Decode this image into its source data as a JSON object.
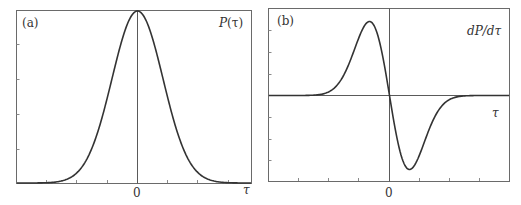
{
  "chart_data": [
    {
      "type": "line",
      "panel_label": "(a)",
      "title": "P(τ)",
      "xlabel": "τ",
      "ylabel": "",
      "x_ticks_labeled": [
        "0"
      ],
      "description": "Gaussian pulse centered at τ=0",
      "function": "gaussian",
      "x": [
        -4,
        -3,
        -2,
        -1.5,
        -1,
        -0.5,
        0,
        0.5,
        1,
        1.5,
        2,
        3,
        4
      ],
      "values": [
        0.0003,
        0.011,
        0.135,
        0.325,
        0.607,
        0.882,
        1.0,
        0.882,
        0.607,
        0.325,
        0.135,
        0.011,
        0.0003
      ],
      "xlim": [
        -4.7,
        4.5
      ],
      "ylim": [
        0,
        1
      ],
      "grid": false,
      "vertical_line_at_x": 0
    },
    {
      "type": "line",
      "panel_label": "(b)",
      "title": "dP/dτ",
      "xlabel": "τ",
      "ylabel": "",
      "x_ticks_labeled": [
        "0"
      ],
      "description": "Derivative of Gaussian: positive lobe for τ<0, negative lobe for τ>0",
      "function": "gaussian-derivative",
      "x": [
        -4,
        -3,
        -2,
        -1.5,
        -1,
        -0.5,
        0,
        0.5,
        1,
        1.5,
        2,
        3,
        4
      ],
      "values": [
        0.001,
        0.034,
        0.27,
        0.49,
        0.607,
        0.441,
        0,
        -0.441,
        -0.607,
        -0.49,
        -0.27,
        -0.034,
        -0.001
      ],
      "xlim": [
        -6,
        6
      ],
      "ylim": [
        -0.7,
        0.7
      ],
      "grid": false,
      "horizontal_axis_at_y": 0,
      "vertical_line_at_x": 0
    }
  ],
  "labels": {
    "panel_a": "(a)",
    "panel_b": "(b)",
    "a_title_P": "P",
    "a_title_rest": "(τ)",
    "b_title": "dP/dτ",
    "tau": "τ",
    "zero": "0"
  }
}
